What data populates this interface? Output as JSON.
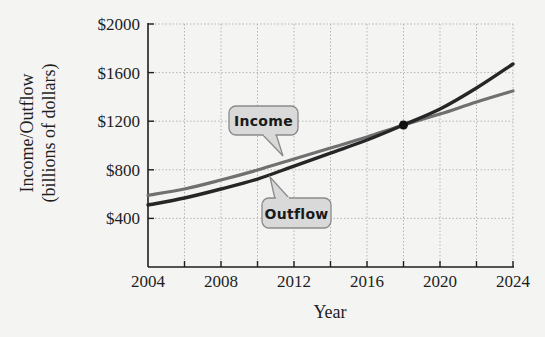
{
  "chart_data": {
    "type": "line",
    "title": "",
    "xlabel": "Year",
    "ylabel": "Income/Outflow (billions of dollars)",
    "ylabel_lines": [
      "Income/Outflow",
      "(billions of dollars)"
    ],
    "x": [
      2004,
      2006,
      2008,
      2010,
      2012,
      2014,
      2016,
      2018,
      2020,
      2022,
      2024
    ],
    "xlim": [
      2004,
      2024
    ],
    "ylim": [
      0,
      2000
    ],
    "x_ticks": [
      2004,
      2006,
      2008,
      2010,
      2012,
      2014,
      2016,
      2018,
      2020,
      2022,
      2024
    ],
    "x_tick_labels": [
      "2004",
      "2008",
      "2012",
      "2016",
      "2020",
      "2024"
    ],
    "x_tick_label_values": [
      2004,
      2008,
      2012,
      2016,
      2020,
      2024
    ],
    "y_ticks": [
      400,
      800,
      1200,
      1600,
      2000
    ],
    "y_tick_labels": [
      "$400",
      "$800",
      "$1200",
      "$1600",
      "$2000"
    ],
    "grid": true,
    "legend": "inline callout labels",
    "series": [
      {
        "name": "Income",
        "color": "#707070",
        "values": [
          590,
          642,
          716,
          798,
          889,
          979,
          1070,
          1169,
          1259,
          1358,
          1449
        ]
      },
      {
        "name": "Outflow",
        "color": "#262626",
        "values": [
          510,
          568,
          642,
          724,
          831,
          938,
          1045,
          1169,
          1300,
          1473,
          1671
        ]
      }
    ],
    "annotations": [
      {
        "type": "point",
        "x": 2018,
        "y": 1169,
        "label": "intersection"
      },
      {
        "type": "callout",
        "text": "Income",
        "target_series": "Income"
      },
      {
        "type": "callout",
        "text": "Outflow",
        "target_series": "Outflow"
      }
    ]
  },
  "labels": {
    "income_callout": "Income",
    "outflow_callout": "Outflow",
    "x_axis_title": "Year",
    "y_axis_title_line1": "Income/Outflow",
    "y_axis_title_line2": "(billions of dollars)"
  },
  "style": {
    "axis_color": "#1e1e1e",
    "grid_color": "#b5b5b5",
    "bubble_fill": "#d9d9d9",
    "bubble_stroke": "#8a8a8a",
    "point_color": "#111111"
  }
}
